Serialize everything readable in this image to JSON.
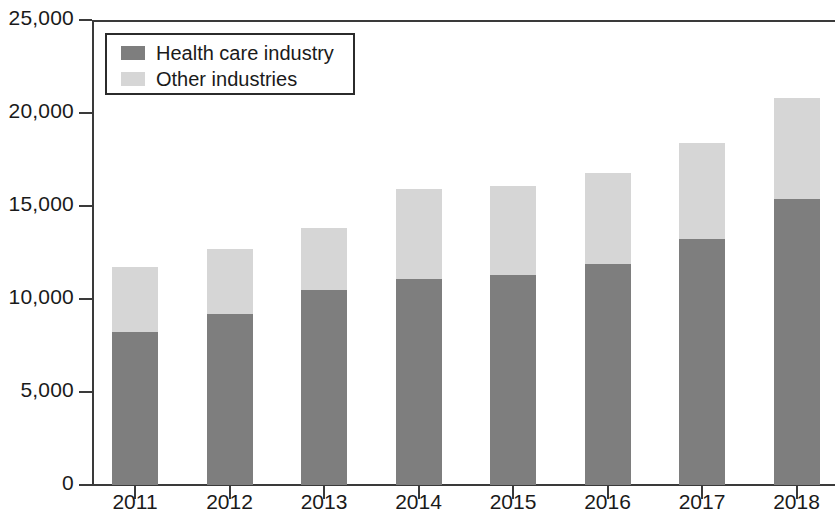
{
  "chart_data": {
    "type": "bar",
    "subtype": "stacked-vertical",
    "title": "",
    "subtitle": "",
    "xlabel": "",
    "ylabel": "",
    "categories": [
      "2011",
      "2012",
      "2013",
      "2014",
      "2015",
      "2016",
      "2017",
      "2018"
    ],
    "series": [
      {
        "name": "Health care industry",
        "color": "#7e7e7e",
        "values": [
          8200,
          9200,
          10500,
          11100,
          11300,
          11900,
          13200,
          15400
        ]
      },
      {
        "name": "Other industries",
        "color": "#d6d6d6",
        "values": [
          3500,
          3500,
          3300,
          4800,
          4800,
          4900,
          5200,
          5400
        ]
      }
    ],
    "totals": [
      11700,
      12700,
      13800,
      15900,
      16100,
      16800,
      18400,
      20800
    ],
    "ylim": [
      0,
      25000
    ],
    "y_ticks": [
      0,
      5000,
      10000,
      15000,
      20000,
      25000
    ],
    "y_tick_labels": [
      "0",
      "5,000",
      "10,000",
      "15,000",
      "20,000",
      "25,000"
    ],
    "grid": false,
    "legend_position": "top-left",
    "legend_entries": [
      "Health care industry",
      "Other industries"
    ]
  }
}
